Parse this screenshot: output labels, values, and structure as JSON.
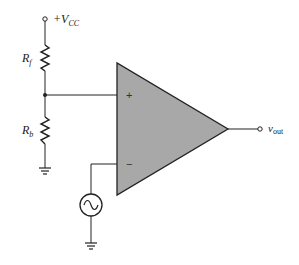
{
  "diagram": {
    "type": "circuit",
    "labels": {
      "vcc_prefix": "+V",
      "vcc_sub": "CC",
      "rf_main": "R",
      "rf_sub": "f",
      "rb_main": "R",
      "rb_sub": "b",
      "vout_main": "v",
      "vout_sub": "out",
      "plus": "+",
      "minus": "−"
    },
    "components": [
      {
        "id": "vcc-terminal",
        "kind": "terminal",
        "label": "+VCC"
      },
      {
        "id": "rf",
        "kind": "resistor",
        "label": "Rf"
      },
      {
        "id": "rb",
        "kind": "resistor",
        "label": "Rb"
      },
      {
        "id": "opamp",
        "kind": "op-amp"
      },
      {
        "id": "ac-source",
        "kind": "ac-voltage-source"
      },
      {
        "id": "ground-rb",
        "kind": "ground"
      },
      {
        "id": "ground-source",
        "kind": "ground"
      },
      {
        "id": "vout-terminal",
        "kind": "terminal",
        "label": "vout"
      }
    ],
    "colors": {
      "opamp_fill": "#a8a8a8",
      "stroke": "#222222"
    }
  }
}
